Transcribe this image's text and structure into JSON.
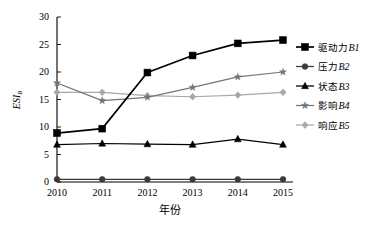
{
  "chart_data": {
    "type": "line",
    "title": "",
    "xlabel": "年份",
    "ylabel": "ESI",
    "ylabel_sub": "B",
    "x": [
      2010,
      2011,
      2012,
      2013,
      2014,
      2015
    ],
    "categories": [
      "2010",
      "2011",
      "2012",
      "2013",
      "2014",
      "2015"
    ],
    "xlim": [
      2010,
      2015
    ],
    "ylim": [
      0,
      30
    ],
    "yticks": [
      0,
      5,
      10,
      15,
      20,
      25,
      30
    ],
    "ytick_labels": [
      "0",
      "5",
      "10",
      "15",
      "20",
      "25",
      "30"
    ],
    "grid": false,
    "legend_position": "right",
    "series": [
      {
        "name": "驱动力B1",
        "label_cjk": "驱动力",
        "label_code": "B1",
        "marker": "square",
        "color": "#000000",
        "values": [
          8.9,
          9.7,
          19.9,
          23.0,
          25.2,
          25.8
        ]
      },
      {
        "name": "压力B2",
        "label_cjk": "压力",
        "label_code": "B2",
        "marker": "circle",
        "color": "#3a3a3a",
        "values": [
          0.5,
          0.5,
          0.5,
          0.5,
          0.5,
          0.5
        ]
      },
      {
        "name": "状态B3",
        "label_cjk": "状态",
        "label_code": "B3",
        "marker": "triangle",
        "color": "#000000",
        "values": [
          6.8,
          7.0,
          6.9,
          6.8,
          7.8,
          6.8
        ]
      },
      {
        "name": "影响B4",
        "label_cjk": "影响",
        "label_code": "B4",
        "marker": "star",
        "color": "#757575",
        "values": [
          18.0,
          14.8,
          15.4,
          17.2,
          19.1,
          20.0
        ]
      },
      {
        "name": "响应B5",
        "label_cjk": "响应",
        "label_code": "B5",
        "marker": "diamond",
        "color": "#a8a8a8",
        "values": [
          16.3,
          16.3,
          15.7,
          15.5,
          15.8,
          16.3
        ]
      }
    ]
  }
}
